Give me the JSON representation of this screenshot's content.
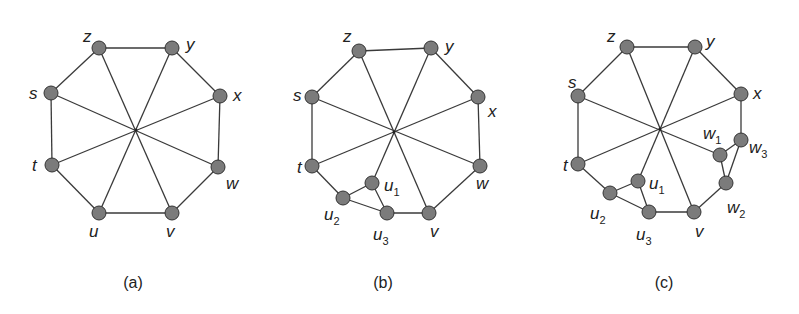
{
  "figure": {
    "panels": [
      {
        "id": "a",
        "caption": "(a)",
        "caption_pos": [
          133,
          288
        ],
        "center": [
          136,
          130
        ],
        "nodes": [
          {
            "id": "z",
            "label": "z",
            "sub": "",
            "x": 99,
            "y": 48,
            "lx": 83,
            "ly": 42
          },
          {
            "id": "y",
            "label": "y",
            "sub": "",
            "x": 172,
            "y": 48,
            "lx": 186,
            "ly": 50
          },
          {
            "id": "x",
            "label": "x",
            "sub": "",
            "x": 220,
            "y": 96,
            "lx": 233,
            "ly": 101
          },
          {
            "id": "w",
            "label": "w",
            "sub": "",
            "x": 218,
            "y": 167,
            "lx": 226,
            "ly": 189
          },
          {
            "id": "v",
            "label": "v",
            "sub": "",
            "x": 172,
            "y": 213,
            "lx": 166,
            "ly": 237
          },
          {
            "id": "u",
            "label": "u",
            "sub": "",
            "x": 99,
            "y": 213,
            "lx": 89,
            "ly": 237
          },
          {
            "id": "t",
            "label": "t",
            "sub": "",
            "x": 52,
            "y": 165,
            "lx": 32,
            "ly": 171
          },
          {
            "id": "s",
            "label": "s",
            "sub": "",
            "x": 51,
            "y": 93,
            "lx": 29,
            "ly": 99
          }
        ],
        "edges": [
          [
            "z",
            "y"
          ],
          [
            "y",
            "x"
          ],
          [
            "x",
            "w"
          ],
          [
            "w",
            "v"
          ],
          [
            "v",
            "u"
          ],
          [
            "u",
            "t"
          ],
          [
            "t",
            "s"
          ],
          [
            "s",
            "z"
          ],
          [
            "z",
            "v"
          ],
          [
            "y",
            "u"
          ],
          [
            "x",
            "t"
          ],
          [
            "w",
            "s"
          ]
        ],
        "spokes": [
          "z",
          "y",
          "x",
          "w",
          "v",
          "u",
          "t",
          "s"
        ]
      },
      {
        "id": "b",
        "caption": "(b)",
        "caption_pos": [
          383,
          288
        ],
        "center": [
          394,
          132
        ],
        "nodes": [
          {
            "id": "z",
            "label": "z",
            "sub": "",
            "x": 359,
            "y": 51,
            "lx": 343,
            "ly": 42
          },
          {
            "id": "y",
            "label": "y",
            "sub": "",
            "x": 431,
            "y": 48,
            "lx": 445,
            "ly": 52
          },
          {
            "id": "x",
            "label": "x",
            "sub": "",
            "x": 478,
            "y": 97,
            "lx": 488,
            "ly": 117
          },
          {
            "id": "w",
            "label": "w",
            "sub": "",
            "x": 480,
            "y": 166,
            "lx": 476,
            "ly": 189
          },
          {
            "id": "v",
            "label": "v",
            "sub": "",
            "x": 429,
            "y": 213,
            "lx": 430,
            "ly": 237
          },
          {
            "id": "u3",
            "label": "u",
            "sub": "3",
            "x": 387,
            "y": 213,
            "lx": 373,
            "ly": 240
          },
          {
            "id": "u2",
            "label": "u",
            "sub": "2",
            "x": 343,
            "y": 198,
            "lx": 324,
            "ly": 220
          },
          {
            "id": "u1",
            "label": "u",
            "sub": "1",
            "x": 372,
            "y": 183,
            "lx": 384,
            "ly": 191
          },
          {
            "id": "t",
            "label": "t",
            "sub": "",
            "x": 312,
            "y": 166,
            "lx": 297,
            "ly": 173
          },
          {
            "id": "s",
            "label": "s",
            "sub": "",
            "x": 312,
            "y": 97,
            "lx": 293,
            "ly": 101
          }
        ],
        "edges": [
          [
            "z",
            "y"
          ],
          [
            "y",
            "x"
          ],
          [
            "x",
            "w"
          ],
          [
            "w",
            "v"
          ],
          [
            "v",
            "u3"
          ],
          [
            "u3",
            "u2"
          ],
          [
            "u2",
            "t"
          ],
          [
            "t",
            "s"
          ],
          [
            "s",
            "z"
          ],
          [
            "u1",
            "u2"
          ],
          [
            "u1",
            "u3"
          ],
          [
            "z",
            "v"
          ],
          [
            "y",
            "u1"
          ],
          [
            "x",
            "t"
          ],
          [
            "w",
            "s"
          ]
        ],
        "spokes": [
          "z",
          "y",
          "x",
          "w",
          "v",
          "u1",
          "t",
          "s"
        ]
      },
      {
        "id": "c",
        "caption": "(c)",
        "caption_pos": [
          664,
          288
        ],
        "center": [
          660,
          129
        ],
        "nodes": [
          {
            "id": "z",
            "label": "z",
            "sub": "",
            "x": 627,
            "y": 47,
            "lx": 607,
            "ly": 42
          },
          {
            "id": "y",
            "label": "y",
            "sub": "",
            "x": 695,
            "y": 47,
            "lx": 706,
            "ly": 47
          },
          {
            "id": "x",
            "label": "x",
            "sub": "",
            "x": 741,
            "y": 94,
            "lx": 753,
            "ly": 99
          },
          {
            "id": "w3",
            "label": "w",
            "sub": "3",
            "x": 741,
            "y": 140,
            "lx": 749,
            "ly": 153
          },
          {
            "id": "w1",
            "label": "w",
            "sub": "1",
            "x": 720,
            "y": 155,
            "lx": 703,
            "ly": 139
          },
          {
            "id": "w2",
            "label": "w",
            "sub": "2",
            "x": 726,
            "y": 183,
            "lx": 727,
            "ly": 213
          },
          {
            "id": "v",
            "label": "v",
            "sub": "",
            "x": 694,
            "y": 212,
            "lx": 695,
            "ly": 237
          },
          {
            "id": "u3",
            "label": "u",
            "sub": "3",
            "x": 649,
            "y": 212,
            "lx": 636,
            "ly": 240
          },
          {
            "id": "u2",
            "label": "u",
            "sub": "2",
            "x": 610,
            "y": 193,
            "lx": 590,
            "ly": 219
          },
          {
            "id": "u1",
            "label": "u",
            "sub": "1",
            "x": 638,
            "y": 181,
            "lx": 649,
            "ly": 189
          },
          {
            "id": "t",
            "label": "t",
            "sub": "",
            "x": 578,
            "y": 164,
            "lx": 563,
            "ly": 171
          },
          {
            "id": "s",
            "label": "s",
            "sub": "",
            "x": 578,
            "y": 96,
            "lx": 568,
            "ly": 88
          }
        ],
        "edges": [
          [
            "z",
            "y"
          ],
          [
            "y",
            "x"
          ],
          [
            "x",
            "w3"
          ],
          [
            "w3",
            "w1"
          ],
          [
            "w3",
            "w2"
          ],
          [
            "w1",
            "w2"
          ],
          [
            "w2",
            "v"
          ],
          [
            "v",
            "u3"
          ],
          [
            "u3",
            "u2"
          ],
          [
            "u3",
            "u1"
          ],
          [
            "u1",
            "u2"
          ],
          [
            "u2",
            "t"
          ],
          [
            "t",
            "s"
          ],
          [
            "s",
            "z"
          ],
          [
            "z",
            "v"
          ],
          [
            "y",
            "u1"
          ],
          [
            "x",
            "t"
          ],
          [
            "w1",
            "s"
          ]
        ],
        "spokes": [
          "z",
          "y",
          "x",
          "w1",
          "v",
          "u1",
          "t",
          "s"
        ]
      }
    ]
  }
}
